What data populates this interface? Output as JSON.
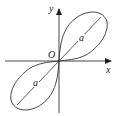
{
  "diagram": {
    "type": "lemniscate",
    "axes": {
      "x_label": "x",
      "y_label": "y",
      "origin_label": "O"
    },
    "segments": [
      {
        "label": "a",
        "position": "upper-right lobe diameter"
      },
      {
        "label": "a",
        "position": "lower-left lobe diameter"
      }
    ],
    "colors": {
      "stroke": "#333333",
      "background": "#ffffff"
    }
  }
}
